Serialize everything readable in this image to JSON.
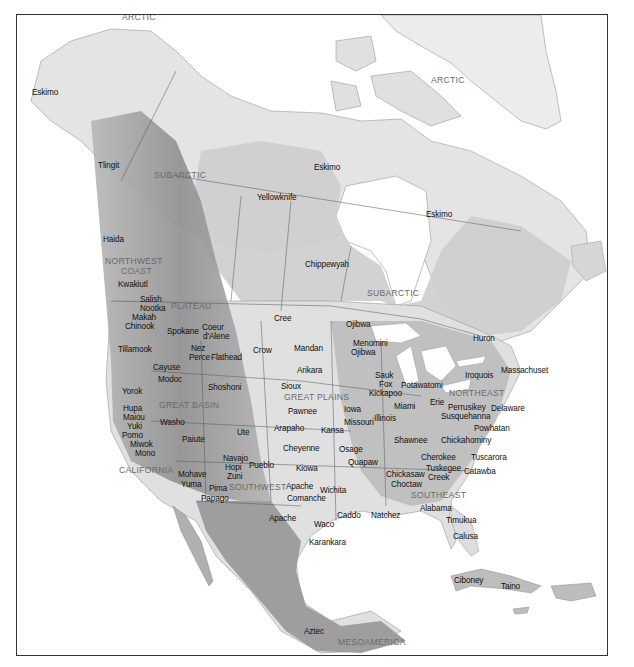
{
  "map": {
    "title": "Culture areas and tribes of North America",
    "colors": {
      "ocean": "#ffffff",
      "arctic": "#e6e6e6",
      "subarctic": "#cfcfcf",
      "plains": "#e2e2e2",
      "east": "#bdbdbd",
      "mountains": "#a8a8a8",
      "mexico": "#9c9c9c",
      "border": "#333333",
      "label_tribe": "#111111",
      "label_region": "#6a6a6a"
    },
    "culture_areas": [
      {
        "name": "ARCTIC",
        "x": 121,
        "y": 12
      },
      {
        "name": "SUBARCTIC",
        "x": 153,
        "y": 170
      },
      {
        "name": "ARCTIC",
        "x": 430,
        "y": 75
      },
      {
        "name": "SUBARCTIC",
        "x": 366,
        "y": 288
      },
      {
        "name": "NORTHWEST",
        "x": 104,
        "y": 256
      },
      {
        "name": "COAST",
        "x": 120,
        "y": 266
      },
      {
        "name": "PLATEAU",
        "x": 170,
        "y": 301
      },
      {
        "name": "GREAT BASIN",
        "x": 158,
        "y": 400
      },
      {
        "name": "GREAT PLAINS",
        "x": 283,
        "y": 392
      },
      {
        "name": "CALIFORNIA",
        "x": 118,
        "y": 465
      },
      {
        "name": "SOUTHWEST",
        "x": 228,
        "y": 482
      },
      {
        "name": "NORTHEAST",
        "x": 448,
        "y": 388
      },
      {
        "name": "SOUTHEAST",
        "x": 410,
        "y": 490
      },
      {
        "name": "MESOAMERICA",
        "x": 337,
        "y": 637
      }
    ],
    "tribes": [
      {
        "name": "Eskimo",
        "x": 31,
        "y": 88
      },
      {
        "name": "Tlingit",
        "x": 97,
        "y": 161
      },
      {
        "name": "Yellowknife",
        "x": 256,
        "y": 193
      },
      {
        "name": "Eskimo",
        "x": 313,
        "y": 163
      },
      {
        "name": "Eskimo",
        "x": 425,
        "y": 210
      },
      {
        "name": "Haida",
        "x": 102,
        "y": 235
      },
      {
        "name": "Chippewyah",
        "x": 304,
        "y": 260
      },
      {
        "name": "Kwakiutl",
        "x": 117,
        "y": 280
      },
      {
        "name": "Salish",
        "x": 139,
        "y": 295
      },
      {
        "name": "Nootka",
        "x": 139,
        "y": 304
      },
      {
        "name": "Makah",
        "x": 131,
        "y": 313
      },
      {
        "name": "Chinook",
        "x": 124,
        "y": 322
      },
      {
        "name": "Cree",
        "x": 273,
        "y": 314
      },
      {
        "name": "Ojibwa",
        "x": 345,
        "y": 320
      },
      {
        "name": "Huron",
        "x": 472,
        "y": 334
      },
      {
        "name": "Spokane",
        "x": 166,
        "y": 327
      },
      {
        "name": "Coeur",
        "x": 201,
        "y": 323
      },
      {
        "name": "d'Alene",
        "x": 202,
        "y": 332
      },
      {
        "name": "Tillamook",
        "x": 117,
        "y": 345
      },
      {
        "name": "Nez",
        "x": 190,
        "y": 344
      },
      {
        "name": "Perce",
        "x": 188,
        "y": 353
      },
      {
        "name": "Flathead",
        "x": 210,
        "y": 353
      },
      {
        "name": "Crow",
        "x": 252,
        "y": 346
      },
      {
        "name": "Mandan",
        "x": 293,
        "y": 344
      },
      {
        "name": "Menomini",
        "x": 352,
        "y": 339
      },
      {
        "name": "Ojibwa",
        "x": 350,
        "y": 348
      },
      {
        "name": "Iroquois",
        "x": 464,
        "y": 371
      },
      {
        "name": "Massachuset",
        "x": 500,
        "y": 366
      },
      {
        "name": "Cayuse",
        "x": 152,
        "y": 363
      },
      {
        "name": "Arikara",
        "x": 296,
        "y": 366
      },
      {
        "name": "Modoc",
        "x": 157,
        "y": 375
      },
      {
        "name": "Sioux",
        "x": 280,
        "y": 382
      },
      {
        "name": "Sauk",
        "x": 374,
        "y": 371
      },
      {
        "name": "Fox",
        "x": 378,
        "y": 380
      },
      {
        "name": "Potawatomi",
        "x": 400,
        "y": 381
      },
      {
        "name": "Kickapoo",
        "x": 368,
        "y": 389
      },
      {
        "name": "Yorok",
        "x": 121,
        "y": 387
      },
      {
        "name": "Shoshoni",
        "x": 207,
        "y": 383
      },
      {
        "name": "Erie",
        "x": 429,
        "y": 398
      },
      {
        "name": "Perrusikey",
        "x": 447,
        "y": 403
      },
      {
        "name": "Delaware",
        "x": 490,
        "y": 404
      },
      {
        "name": "Miami",
        "x": 393,
        "y": 402
      },
      {
        "name": "Pawnee",
        "x": 287,
        "y": 407
      },
      {
        "name": "Iowa",
        "x": 343,
        "y": 405
      },
      {
        "name": "Susquehanna",
        "x": 440,
        "y": 412
      },
      {
        "name": "Hupa",
        "x": 122,
        "y": 404
      },
      {
        "name": "Maiou",
        "x": 122,
        "y": 413
      },
      {
        "name": "Yuki",
        "x": 126,
        "y": 422
      },
      {
        "name": "Pomo",
        "x": 121,
        "y": 431
      },
      {
        "name": "Miwok",
        "x": 129,
        "y": 440
      },
      {
        "name": "Mono",
        "x": 134,
        "y": 449
      },
      {
        "name": "Washo",
        "x": 159,
        "y": 418
      },
      {
        "name": "Illinois",
        "x": 373,
        "y": 414
      },
      {
        "name": "Powhatan",
        "x": 473,
        "y": 424
      },
      {
        "name": "Missouri",
        "x": 343,
        "y": 418
      },
      {
        "name": "Arapaho",
        "x": 273,
        "y": 424
      },
      {
        "name": "Kansa",
        "x": 320,
        "y": 426
      },
      {
        "name": "Ute",
        "x": 236,
        "y": 428
      },
      {
        "name": "Shawnee",
        "x": 393,
        "y": 436
      },
      {
        "name": "Chickahominy",
        "x": 440,
        "y": 436
      },
      {
        "name": "Paiute",
        "x": 181,
        "y": 435
      },
      {
        "name": "Cheyenne",
        "x": 282,
        "y": 444
      },
      {
        "name": "Osage",
        "x": 338,
        "y": 445
      },
      {
        "name": "Quapaw",
        "x": 347,
        "y": 458
      },
      {
        "name": "Cherokee",
        "x": 420,
        "y": 453
      },
      {
        "name": "Tuscarora",
        "x": 470,
        "y": 453
      },
      {
        "name": "Navajo",
        "x": 222,
        "y": 454
      },
      {
        "name": "Hopi",
        "x": 224,
        "y": 463
      },
      {
        "name": "Zuni",
        "x": 226,
        "y": 472
      },
      {
        "name": "Pueblo",
        "x": 248,
        "y": 461
      },
      {
        "name": "Kiowa",
        "x": 295,
        "y": 464
      },
      {
        "name": "Tuskegee",
        "x": 425,
        "y": 464
      },
      {
        "name": "Catawba",
        "x": 463,
        "y": 467
      },
      {
        "name": "Chickasaw",
        "x": 385,
        "y": 470
      },
      {
        "name": "Creek",
        "x": 427,
        "y": 473
      },
      {
        "name": "Mohave",
        "x": 177,
        "y": 470
      },
      {
        "name": "Yuma",
        "x": 180,
        "y": 480
      },
      {
        "name": "Pima",
        "x": 208,
        "y": 484
      },
      {
        "name": "Papago",
        "x": 200,
        "y": 494
      },
      {
        "name": "Choctaw",
        "x": 390,
        "y": 480
      },
      {
        "name": "Apache",
        "x": 285,
        "y": 482
      },
      {
        "name": "Wichita",
        "x": 319,
        "y": 486
      },
      {
        "name": "Comanche",
        "x": 286,
        "y": 494
      },
      {
        "name": "Alabama",
        "x": 419,
        "y": 504
      },
      {
        "name": "Apache",
        "x": 268,
        "y": 514
      },
      {
        "name": "Caddo",
        "x": 336,
        "y": 511
      },
      {
        "name": "Natchez",
        "x": 370,
        "y": 511
      },
      {
        "name": "Timukua",
        "x": 445,
        "y": 516
      },
      {
        "name": "Waco",
        "x": 313,
        "y": 520
      },
      {
        "name": "Karankara",
        "x": 308,
        "y": 538
      },
      {
        "name": "Calusa",
        "x": 452,
        "y": 532
      },
      {
        "name": "Ciboney",
        "x": 453,
        "y": 576
      },
      {
        "name": "Taino",
        "x": 500,
        "y": 582
      },
      {
        "name": "Aztec",
        "x": 303,
        "y": 627
      }
    ]
  }
}
